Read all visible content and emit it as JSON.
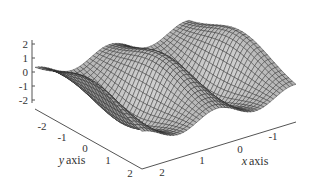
{
  "chart_data": {
    "type": "surface",
    "title": "",
    "xlabel": "x axis",
    "ylabel": "y axis",
    "zlabel": "",
    "x_ticks": [
      "-1",
      "0",
      "1",
      "2"
    ],
    "y_ticks": [
      "-2",
      "-1",
      "0",
      "1",
      "2"
    ],
    "z_ticks": [
      "2",
      "1",
      "0",
      "-1",
      "-2"
    ],
    "xlim": [
      -1.5,
      2.5
    ],
    "ylim": [
      -2.5,
      2.5
    ],
    "zlim": [
      -2.5,
      2.5
    ],
    "style": "gray shaded wireframe mesh",
    "colors": {
      "surface": "#a8a8a8",
      "mesh": "#2a2a2a",
      "axis": "#555555"
    }
  },
  "labels": {
    "x_axis": "x axis",
    "y_axis": "y axis",
    "x_ticks": [
      "-1",
      "0",
      "1",
      "2"
    ],
    "y_ticks": [
      "-2",
      "-1",
      "0",
      "1",
      "2"
    ],
    "z_ticks": [
      "2",
      "1",
      "0",
      "-1",
      "-2"
    ]
  }
}
